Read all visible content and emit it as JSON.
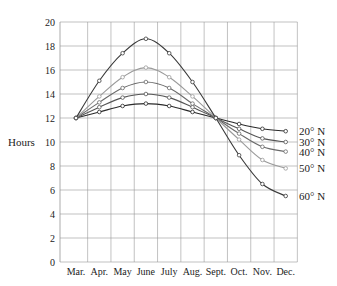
{
  "chart_data": {
    "type": "line",
    "title": "",
    "xlabel": "",
    "ylabel": "Hours",
    "ylim": [
      0,
      20
    ],
    "yticks": [
      0,
      2,
      4,
      6,
      8,
      10,
      12,
      14,
      16,
      18,
      20
    ],
    "grid": true,
    "legend_position": "right, inline labels at line ends",
    "categories": [
      "Mar.",
      "Apr.",
      "May",
      "June",
      "July",
      "Aug.",
      "Sept.",
      "Oct.",
      "Nov.",
      "Dec."
    ],
    "series": [
      {
        "name": "20° N",
        "color": "#2a2a2a",
        "values": [
          12,
          12.5,
          13.0,
          13.2,
          13.0,
          12.5,
          12,
          11.5,
          11.1,
          10.9
        ]
      },
      {
        "name": "30° N",
        "color": "#555555",
        "values": [
          12,
          12.9,
          13.7,
          14.0,
          13.7,
          12.9,
          12,
          11.1,
          10.3,
          10.0
        ]
      },
      {
        "name": "40° N",
        "color": "#6a6a6a",
        "values": [
          12,
          13.3,
          14.5,
          15.0,
          14.5,
          13.2,
          12,
          10.7,
          9.6,
          9.2
        ]
      },
      {
        "name": "50° N",
        "color": "#9a9a9a",
        "values": [
          12,
          13.8,
          15.4,
          16.2,
          15.4,
          13.8,
          12,
          10.2,
          8.5,
          7.8
        ]
      },
      {
        "name": "60° N",
        "color": "#3a3a3a",
        "values": [
          12,
          15.1,
          17.4,
          18.6,
          17.4,
          15.0,
          12,
          8.9,
          6.5,
          5.5
        ]
      }
    ]
  }
}
